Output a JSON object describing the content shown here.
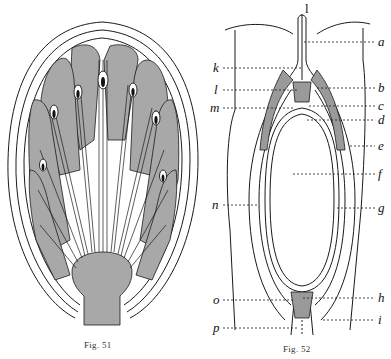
{
  "figures": [
    {
      "id": "fig51",
      "caption": "Fig. 51",
      "description": "Longitudinal section of a flower bud / inflorescence with radiating bundles and shaded tissue lobes on a stalk"
    },
    {
      "id": "fig52",
      "caption": "Fig. 52",
      "description": "Longitudinal section of an ovule/embryo sac with lettered parts",
      "top_label": "l",
      "labels_left": [
        "k",
        "l",
        "m",
        "n",
        "o",
        "p"
      ],
      "labels_right": [
        "a",
        "b",
        "c",
        "d",
        "e",
        "f",
        "g",
        "h",
        "i"
      ]
    }
  ],
  "colors": {
    "line": "#1a1a1a",
    "shade": "#a8a8a8",
    "background": "#ffffff"
  }
}
